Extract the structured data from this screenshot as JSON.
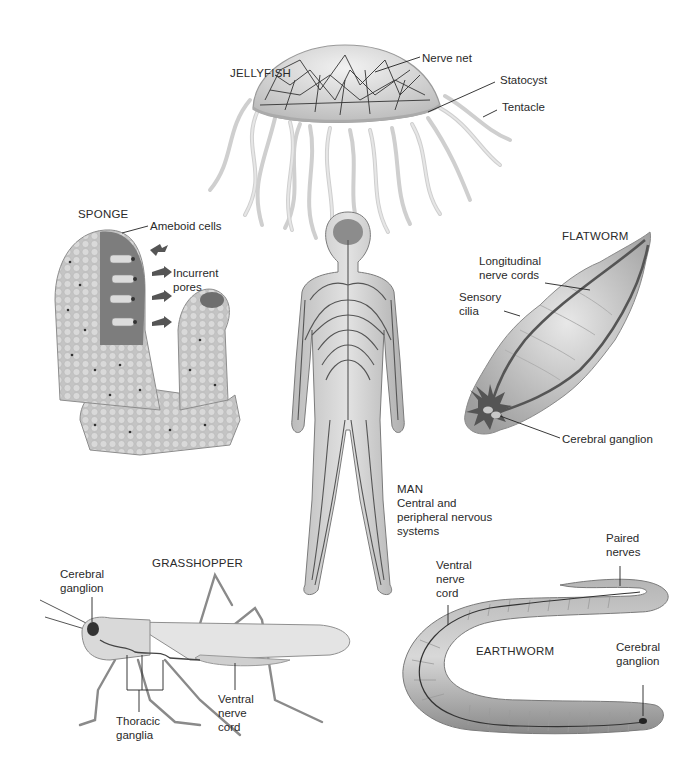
{
  "figure": {
    "panels": [
      {
        "id": "jellyfish",
        "title": "JELLYFISH",
        "labels": [
          "Nerve net",
          "Statocyst",
          "Tentacle"
        ]
      },
      {
        "id": "sponge",
        "title": "SPONGE",
        "labels": [
          "Ameboid cells",
          "Incurrent pores"
        ]
      },
      {
        "id": "flatworm",
        "title": "FLATWORM",
        "labels": [
          "Longitudinal nerve cords",
          "Sensory cilia",
          "Cerebral ganglion"
        ]
      },
      {
        "id": "man",
        "title": "MAN",
        "caption_lines": [
          "Central and",
          "peripheral nervous",
          "systems"
        ]
      },
      {
        "id": "grasshopper",
        "title": "GRASSHOPPER",
        "labels": [
          "Cerebral ganglion",
          "Thoracic ganglia",
          "Ventral nerve cord"
        ]
      },
      {
        "id": "earthworm",
        "title": "EARTHWORM",
        "labels": [
          "Paired nerves",
          "Ventral nerve cord",
          "Cerebral ganglion"
        ]
      }
    ]
  },
  "jellyfish": {
    "title": "JELLYFISH",
    "nerve_net": "Nerve net",
    "statocyst": "Statocyst",
    "tentacle": "Tentacle"
  },
  "sponge": {
    "title": "SPONGE",
    "ameboid": "Ameboid cells",
    "incurrent_1": "Incurrent",
    "incurrent_2": "pores"
  },
  "flatworm": {
    "title": "FLATWORM",
    "longitudinal_1": "Longitudinal",
    "longitudinal_2": "nerve cords",
    "sensory_1": "Sensory",
    "sensory_2": "cilia",
    "cerebral": "Cerebral ganglion"
  },
  "man": {
    "title": "MAN",
    "line1": "Central and",
    "line2": "peripheral nervous",
    "line3": "systems"
  },
  "grasshopper": {
    "title": "GRASSHOPPER",
    "cerebral_1": "Cerebral",
    "cerebral_2": "ganglion",
    "thoracic_1": "Thoracic",
    "thoracic_2": "ganglia",
    "ventral_1": "Ventral",
    "ventral_2": "nerve",
    "ventral_3": "cord"
  },
  "earthworm": {
    "title": "EARTHWORM",
    "paired_1": "Paired",
    "paired_2": "nerves",
    "ventral_1": "Ventral",
    "ventral_2": "nerve",
    "ventral_3": "cord",
    "cerebral_1": "Cerebral",
    "cerebral_2": "ganglion"
  },
  "colors": {
    "tissue": "#c9c9c9",
    "tissue_light": "#e6e6e6",
    "tissue_dark": "#8f8f8f",
    "nerve": "#4a4a4a",
    "sponge_interior": "#7d7d7d",
    "label_text": "#2a2a2a"
  }
}
